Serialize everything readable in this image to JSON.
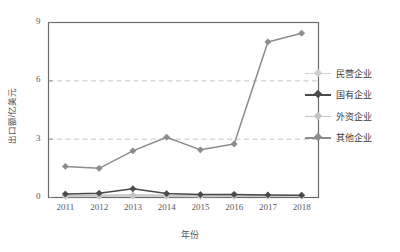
{
  "chart_data": {
    "type": "line",
    "title": "",
    "xlabel": "年份",
    "ylabel": "出口额/亿美元",
    "categories": [
      "2011",
      "2012",
      "2013",
      "2014",
      "2015",
      "2016",
      "2017",
      "2018"
    ],
    "ylim": [
      0,
      9
    ],
    "yticks": [
      0,
      3,
      6,
      9
    ],
    "grid": "horizontal dashed at 3 and 6",
    "legend_position": "right",
    "series": [
      {
        "name": "民营企业",
        "color": "#cfcfcf",
        "marker": "diamond",
        "values": [
          0.05,
          0.06,
          0.07,
          0.06,
          0.05,
          0.06,
          0.07,
          0.08
        ]
      },
      {
        "name": "国有企业",
        "color": "#4a4a4a",
        "marker": "diamond",
        "values": [
          0.18,
          0.22,
          0.45,
          0.2,
          0.15,
          0.16,
          0.13,
          0.12
        ]
      },
      {
        "name": "外资企业",
        "color": "#c3c3c3",
        "marker": "diamond",
        "values": [
          0.1,
          0.12,
          0.13,
          0.11,
          0.1,
          0.1,
          0.09,
          0.09
        ]
      },
      {
        "name": "其他企业",
        "color": "#8c8c8c",
        "marker": "diamond",
        "values": [
          1.6,
          1.5,
          2.4,
          3.1,
          2.45,
          2.75,
          8.0,
          8.45
        ]
      }
    ]
  },
  "legend": {
    "items": [
      {
        "label": "民营企业"
      },
      {
        "label": "国有企业"
      },
      {
        "label": "外资企业"
      },
      {
        "label": "其他企业"
      }
    ]
  },
  "axes": {
    "y_tick_labels": [
      "9",
      "6",
      "3",
      "0"
    ],
    "x_tick_labels": [
      "2011",
      "2012",
      "2013",
      "2014",
      "2015",
      "2016",
      "2017",
      "2018"
    ],
    "y_title": "出口额/亿美元",
    "x_title": "年份"
  }
}
